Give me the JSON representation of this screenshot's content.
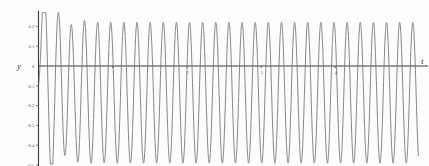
{
  "figure": {
    "title": "",
    "axis_labels": {
      "x": "t",
      "y": "y"
    }
  },
  "chart_data": {
    "type": "line",
    "title": "",
    "xlabel": "t",
    "ylabel": "y",
    "xlim": [
      0,
      5.25
    ],
    "ylim": [
      -0.5,
      0.25
    ],
    "grid": false,
    "legend": null,
    "x_ticks": [
      1,
      2,
      3,
      4
    ],
    "x_tick_labels": [
      "1",
      "2",
      "3",
      "4"
    ],
    "y_ticks": [
      0.2,
      0.1,
      0,
      -0.1,
      -0.2,
      -0.3,
      -0.4,
      -0.5
    ],
    "y_tick_labels": [
      "0.2",
      "0.1",
      "0",
      "-0.1",
      "-0.2",
      "-0.3",
      "-0.4",
      "-0.5"
    ],
    "steady_state": {
      "peak": 0.22,
      "trough": -0.49,
      "offset": -0.135,
      "amplitude": 0.355,
      "cycles_visible": 29,
      "period": 0.177
    },
    "transient_points": [
      {
        "t": 0.0,
        "y": 0.1
      },
      {
        "t": 0.03,
        "y": -0.02
      },
      {
        "t": 0.06,
        "y": -0.16
      },
      {
        "t": 0.1,
        "y": -0.17
      },
      {
        "t": 0.145,
        "y": 0.19
      },
      {
        "t": 0.23,
        "y": -0.33
      },
      {
        "t": 0.33,
        "y": 0.22
      },
      {
        "t": 0.41,
        "y": -0.49
      }
    ],
    "series": [
      {
        "name": "y(t)",
        "color": "#6d6d6d",
        "x_start": 0.0,
        "x_end": 5.12
      }
    ]
  },
  "colors": {
    "curve": "#6d6d6d",
    "axis": "#3a3a3a",
    "text": "#5d5d5d",
    "background": "#fdfdfc"
  }
}
